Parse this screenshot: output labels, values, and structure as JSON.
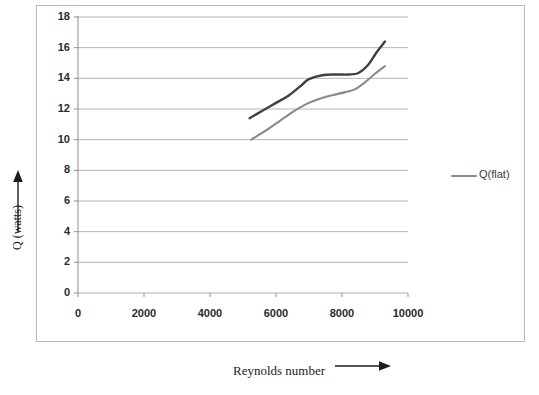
{
  "chart_data": {
    "type": "line",
    "title": "",
    "xlabel": "Reynolds number",
    "ylabel": "Q (watts)",
    "xlim": [
      0,
      10000
    ],
    "ylim": [
      0,
      18
    ],
    "xticks": [
      0,
      2000,
      4000,
      6000,
      8000,
      10000
    ],
    "yticks": [
      0,
      2,
      4,
      6,
      8,
      10,
      12,
      14,
      16,
      18
    ],
    "xtick_labels": [
      "0",
      "2000",
      "4000",
      "6000",
      "8000",
      "10000"
    ],
    "ytick_labels": [
      "0",
      "2",
      "4",
      "6",
      "8",
      "10",
      "12",
      "14",
      "16",
      "18"
    ],
    "grid": "horizontal",
    "legend_position": "right",
    "legend": [
      {
        "name": "Q(flat)",
        "color": "#8a8a8a"
      }
    ],
    "series": [
      {
        "name": "upper-curve",
        "color": "#414141",
        "x": [
          5200,
          5600,
          6000,
          6400,
          6800,
          7000,
          7400,
          7800,
          8200,
          8500,
          8800,
          9050,
          9300
        ],
        "y": [
          11.4,
          11.9,
          12.4,
          12.9,
          13.6,
          13.95,
          14.2,
          14.25,
          14.25,
          14.35,
          14.9,
          15.7,
          16.4
        ]
      },
      {
        "name": "Q(flat)",
        "color": "#8a8a8a",
        "x": [
          5250,
          5700,
          6100,
          6500,
          6900,
          7300,
          7700,
          8100,
          8400,
          8700,
          9000,
          9300
        ],
        "y": [
          10.0,
          10.6,
          11.2,
          11.8,
          12.3,
          12.65,
          12.9,
          13.1,
          13.3,
          13.75,
          14.3,
          14.8
        ]
      }
    ]
  },
  "axis": {
    "y_title": "Q (watts)",
    "x_title": "Reynolds number"
  },
  "icons": {
    "y_arrow": "up-arrow-icon",
    "x_arrow": "right-arrow-icon",
    "legend_swatch": "line-swatch-icon"
  }
}
